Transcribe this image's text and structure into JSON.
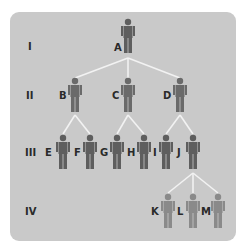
{
  "diagram": {
    "type": "pedigree",
    "background_color": "#c9c9c9",
    "line_color": "#f2f2f2",
    "colors": {
      "dark_figure": "#5e5e5e",
      "light_figure": "#8a8a8a"
    },
    "generations": [
      {
        "label": "I"
      },
      {
        "label": "II"
      },
      {
        "label": "III"
      },
      {
        "label": "IV"
      }
    ],
    "individuals": [
      {
        "id": "A",
        "label": "A",
        "generation": "I"
      },
      {
        "id": "B",
        "label": "B",
        "generation": "II",
        "parent": "A"
      },
      {
        "id": "C",
        "label": "C",
        "generation": "II",
        "parent": "A"
      },
      {
        "id": "D",
        "label": "D",
        "generation": "II",
        "parent": "A"
      },
      {
        "id": "E",
        "label": "E",
        "generation": "III",
        "parent": "B"
      },
      {
        "id": "F",
        "label": "F",
        "generation": "III",
        "parent": "B"
      },
      {
        "id": "G",
        "label": "G",
        "generation": "III",
        "parent": "C"
      },
      {
        "id": "H",
        "label": "H",
        "generation": "III",
        "parent": "C"
      },
      {
        "id": "I",
        "label": "I",
        "generation": "III",
        "parent": "D"
      },
      {
        "id": "J",
        "label": "J",
        "generation": "III",
        "parent": "D"
      },
      {
        "id": "K",
        "label": "K",
        "generation": "IV",
        "parent": "J"
      },
      {
        "id": "L",
        "label": "L",
        "generation": "IV",
        "parent": "J"
      },
      {
        "id": "M",
        "label": "M",
        "generation": "IV",
        "parent": "J"
      }
    ]
  }
}
